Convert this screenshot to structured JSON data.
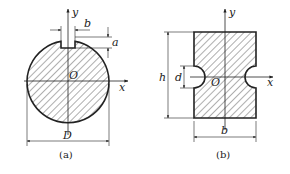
{
  "figures": [
    {
      "id": "a",
      "caption": "(a)",
      "shape": "circular cross-section with rectangular keyway",
      "labels": {
        "y": "y",
        "x": "x",
        "origin": "O",
        "width": "b",
        "depth": "a",
        "diameter": "D"
      }
    },
    {
      "id": "b",
      "caption": "(b)",
      "shape": "rectangular cross-section with two semicircular side notches",
      "labels": {
        "y": "y",
        "x": "x",
        "origin": "O",
        "height": "h",
        "notch": "d",
        "width": "b"
      }
    }
  ],
  "colors": {
    "stroke": "#222222",
    "hatch": "#333333",
    "background": "#ffffff"
  }
}
